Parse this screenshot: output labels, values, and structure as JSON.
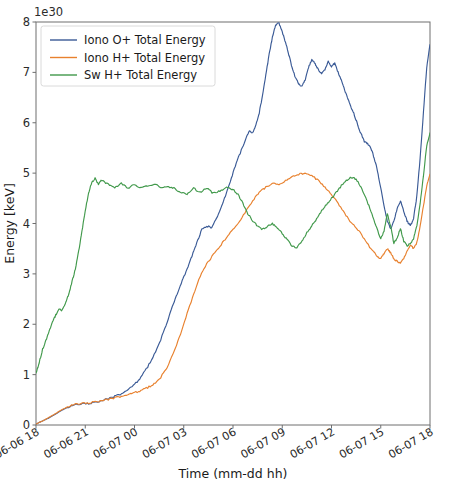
{
  "chart_data": {
    "type": "line",
    "title": "",
    "xlabel": "Time (mm-dd hh)",
    "ylabel": "Energy [keV]",
    "y_offset_text": "1e30",
    "ylim": [
      0,
      8
    ],
    "yticks": [
      0,
      1,
      2,
      3,
      4,
      5,
      6,
      7,
      8
    ],
    "ytick_labels": [
      "0",
      "1",
      "2",
      "3",
      "4",
      "5",
      "6",
      "7",
      "8"
    ],
    "xlim": [
      0,
      24
    ],
    "xticks": [
      0,
      3,
      6,
      9,
      12,
      15,
      18,
      21,
      24
    ],
    "xtick_labels": [
      "06-06 18",
      "06-06 21",
      "06-07 00",
      "06-07 03",
      "06-07 06",
      "06-07 09",
      "06-07 12",
      "06-07 15",
      "06-07 18"
    ],
    "grid": false,
    "legend_position": "upper left",
    "series": [
      {
        "name": "Iono O+ Total Energy",
        "color": "#3a5a96",
        "x": [
          0.0,
          0.4,
          0.8,
          1.2,
          1.6,
          2.0,
          2.4,
          2.8,
          3.2,
          3.6,
          4.0,
          4.4,
          4.8,
          5.2,
          5.6,
          6.0,
          6.4,
          6.8,
          7.2,
          7.6,
          8.0,
          8.3,
          8.6,
          8.9,
          9.2,
          9.5,
          9.8,
          10.1,
          10.4,
          10.7,
          11.0,
          11.3,
          11.6,
          11.9,
          12.2,
          12.5,
          12.8,
          13.0,
          13.2,
          13.4,
          13.6,
          13.8,
          14.0,
          14.2,
          14.4,
          14.6,
          14.8,
          15.0,
          15.2,
          15.4,
          15.6,
          15.8,
          16.0,
          16.2,
          16.4,
          16.6,
          16.8,
          17.0,
          17.2,
          17.4,
          17.6,
          17.8,
          18.0,
          18.2,
          18.4,
          18.6,
          18.8,
          19.0,
          19.2,
          19.4,
          19.6,
          19.8,
          20.0,
          20.2,
          20.4,
          20.6,
          20.8,
          21.0,
          21.2,
          21.4,
          21.6,
          21.8,
          22.0,
          22.2,
          22.4,
          22.6,
          22.8,
          23.0,
          23.2,
          23.4,
          23.6,
          23.8,
          24.0
        ],
        "y": [
          0.02,
          0.08,
          0.14,
          0.22,
          0.3,
          0.36,
          0.4,
          0.42,
          0.43,
          0.45,
          0.48,
          0.52,
          0.57,
          0.62,
          0.7,
          0.8,
          0.95,
          1.15,
          1.4,
          1.7,
          2.05,
          2.35,
          2.6,
          2.85,
          3.1,
          3.35,
          3.62,
          3.88,
          3.95,
          3.92,
          4.1,
          4.35,
          4.6,
          4.9,
          5.2,
          5.45,
          5.7,
          5.85,
          5.8,
          5.95,
          6.2,
          6.55,
          6.95,
          7.35,
          7.7,
          7.95,
          7.98,
          7.8,
          7.6,
          7.35,
          7.1,
          6.9,
          6.78,
          6.72,
          6.85,
          7.1,
          7.25,
          7.18,
          7.05,
          6.98,
          7.05,
          7.22,
          7.12,
          7.18,
          7.0,
          6.85,
          6.65,
          6.48,
          6.3,
          6.15,
          5.95,
          5.78,
          5.62,
          5.58,
          5.5,
          5.3,
          5.05,
          4.7,
          4.35,
          4.05,
          3.9,
          4.05,
          4.3,
          4.45,
          4.25,
          4.05,
          3.95,
          4.1,
          4.55,
          5.3,
          6.2,
          7.1,
          7.55
        ]
      },
      {
        "name": "Iono H+ Total Energy",
        "color": "#e8812e",
        "x": [
          0.0,
          0.4,
          0.8,
          1.2,
          1.6,
          2.0,
          2.4,
          2.8,
          3.2,
          3.6,
          4.0,
          4.4,
          4.8,
          5.2,
          5.6,
          6.0,
          6.4,
          6.8,
          7.2,
          7.6,
          8.0,
          8.4,
          8.8,
          9.2,
          9.6,
          10.0,
          10.4,
          10.8,
          11.2,
          11.6,
          12.0,
          12.4,
          12.8,
          13.2,
          13.6,
          14.0,
          14.4,
          14.8,
          15.2,
          15.6,
          16.0,
          16.4,
          16.8,
          17.2,
          17.6,
          18.0,
          18.4,
          18.8,
          19.2,
          19.6,
          20.0,
          20.4,
          20.8,
          21.0,
          21.2,
          21.4,
          21.6,
          21.8,
          22.0,
          22.2,
          22.4,
          22.6,
          22.8,
          23.0,
          23.2,
          23.4,
          23.6,
          23.8,
          24.0
        ],
        "y": [
          0.02,
          0.08,
          0.15,
          0.23,
          0.31,
          0.37,
          0.41,
          0.43,
          0.44,
          0.46,
          0.48,
          0.51,
          0.54,
          0.57,
          0.6,
          0.64,
          0.68,
          0.74,
          0.82,
          0.95,
          1.15,
          1.45,
          1.8,
          2.2,
          2.6,
          2.95,
          3.2,
          3.38,
          3.55,
          3.72,
          3.88,
          4.05,
          4.25,
          4.45,
          4.62,
          4.72,
          4.8,
          4.78,
          4.85,
          4.92,
          4.98,
          5.0,
          4.95,
          4.85,
          4.72,
          4.58,
          4.4,
          4.2,
          4.02,
          3.88,
          3.7,
          3.5,
          3.35,
          3.3,
          3.4,
          3.5,
          3.42,
          3.3,
          3.25,
          3.22,
          3.3,
          3.45,
          3.58,
          3.5,
          3.62,
          3.95,
          4.35,
          4.75,
          4.98
        ]
      },
      {
        "name": "Sw H+ Total Energy",
        "color": "#41994b",
        "x": [
          0.0,
          0.2,
          0.4,
          0.6,
          0.8,
          1.0,
          1.2,
          1.4,
          1.6,
          1.8,
          2.0,
          2.2,
          2.4,
          2.6,
          2.8,
          3.0,
          3.2,
          3.4,
          3.6,
          3.8,
          4.0,
          4.4,
          4.8,
          5.2,
          5.6,
          6.0,
          6.4,
          6.8,
          7.2,
          7.6,
          8.0,
          8.4,
          8.8,
          9.2,
          9.6,
          10.0,
          10.4,
          10.8,
          11.2,
          11.6,
          12.0,
          12.3,
          12.6,
          12.9,
          13.2,
          13.5,
          13.8,
          14.1,
          14.4,
          14.7,
          15.0,
          15.3,
          15.6,
          15.9,
          16.2,
          16.5,
          16.8,
          17.1,
          17.4,
          17.7,
          18.0,
          18.3,
          18.6,
          18.9,
          19.2,
          19.5,
          19.8,
          20.1,
          20.4,
          20.7,
          21.0,
          21.2,
          21.4,
          21.6,
          21.8,
          22.0,
          22.2,
          22.4,
          22.6,
          22.8,
          23.0,
          23.2,
          23.4,
          23.6,
          23.8,
          24.0
        ],
        "y": [
          1.02,
          1.25,
          1.5,
          1.68,
          1.85,
          2.05,
          2.18,
          2.3,
          2.28,
          2.42,
          2.6,
          2.85,
          3.1,
          3.45,
          3.85,
          4.25,
          4.6,
          4.82,
          4.9,
          4.78,
          4.86,
          4.78,
          4.72,
          4.8,
          4.7,
          4.78,
          4.7,
          4.74,
          4.78,
          4.72,
          4.74,
          4.7,
          4.62,
          4.58,
          4.7,
          4.62,
          4.7,
          4.6,
          4.65,
          4.72,
          4.68,
          4.58,
          4.4,
          4.2,
          4.05,
          3.95,
          3.88,
          3.95,
          4.0,
          3.92,
          3.8,
          3.68,
          3.55,
          3.52,
          3.65,
          3.82,
          3.95,
          4.1,
          4.25,
          4.38,
          4.5,
          4.62,
          4.75,
          4.85,
          4.92,
          4.88,
          4.72,
          4.5,
          4.25,
          3.95,
          3.7,
          3.85,
          4.2,
          3.95,
          3.6,
          3.72,
          3.9,
          3.65,
          3.55,
          3.6,
          3.7,
          3.95,
          4.4,
          4.95,
          5.55,
          5.8
        ]
      }
    ]
  }
}
